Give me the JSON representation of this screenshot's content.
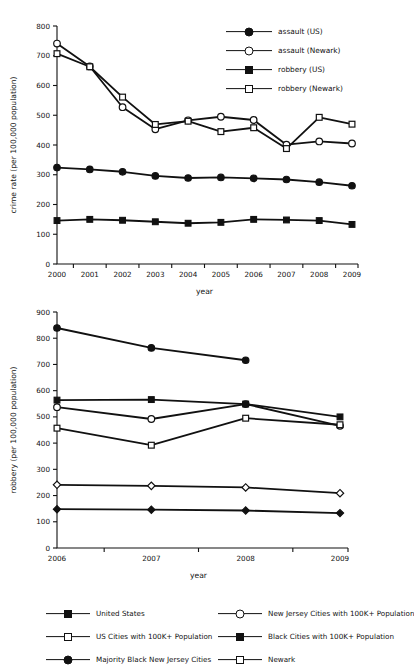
{
  "chart_data": [
    {
      "type": "line",
      "id": "crime-rate-us-newark",
      "title": "",
      "xlabel": "year",
      "ylabel": "crime rate (per 100,000 population)",
      "x": [
        2000,
        2001,
        2002,
        2003,
        2004,
        2005,
        2006,
        2007,
        2008,
        2009
      ],
      "xticklabels": [
        "2000",
        "2001",
        "2002",
        "2003",
        "2004",
        "2005",
        "2006",
        "2007",
        "2008",
        "2009"
      ],
      "yticks": [
        0,
        100,
        200,
        300,
        400,
        500,
        600,
        700,
        800
      ],
      "yticklabels": [
        "0",
        "100",
        "200",
        "300",
        "400",
        "500",
        "600",
        "700",
        "800"
      ],
      "ylim": [
        0,
        800
      ],
      "grid": false,
      "legend_position": "upper right",
      "series": [
        {
          "name": "assault (US)",
          "marker": "circle-filled",
          "values": [
            324,
            318,
            310,
            296,
            289,
            291,
            288,
            284,
            275,
            263
          ]
        },
        {
          "name": "assault (Newark)",
          "marker": "circle-open",
          "values": [
            741,
            664,
            527,
            453,
            483,
            495,
            484,
            401,
            412,
            405
          ]
        },
        {
          "name": "robbery (US)",
          "marker": "square-filled",
          "values": [
            146,
            150,
            147,
            142,
            137,
            140,
            150,
            148,
            146,
            133
          ]
        },
        {
          "name": "robbery (Newark)",
          "marker": "square-open",
          "values": [
            707,
            663,
            561,
            469,
            480,
            445,
            458,
            388,
            493,
            470
          ]
        }
      ]
    },
    {
      "type": "line",
      "id": "robbery-city-comparison",
      "title": "",
      "xlabel": "year",
      "ylabel": "robbery (per 100,000 population)",
      "x": [
        2006,
        2007,
        2008,
        2009
      ],
      "xticklabels": [
        "2006",
        "2007",
        "2008",
        "2009"
      ],
      "yticks": [
        0,
        100,
        200,
        300,
        400,
        500,
        600,
        700,
        800,
        900
      ],
      "yticklabels": [
        "0",
        "100",
        "200",
        "300",
        "400",
        "500",
        "600",
        "700",
        "800",
        "900"
      ],
      "ylim": [
        0,
        900
      ],
      "grid": false,
      "legend_position": "below",
      "series": [
        {
          "name": "United States",
          "marker": "diamond-filled",
          "values": [
            148,
            146,
            143,
            133
          ]
        },
        {
          "name": "US Cities with 100K+ Population",
          "marker": "diamond-open",
          "values": [
            241,
            237,
            231,
            209
          ]
        },
        {
          "name": "New Jersey Cities with 100K+ Population",
          "marker": "circle-open",
          "values": [
            537,
            492,
            549,
            466
          ]
        },
        {
          "name": "Black Cities with 100K+ Population",
          "marker": "square-filled",
          "values": [
            564,
            566,
            549,
            500
          ]
        },
        {
          "name": "Majority Black New Jersey Cities",
          "marker": "circle-filled",
          "values": [
            839,
            763,
            716,
            null
          ]
        },
        {
          "name": "Newark",
          "marker": "square-open",
          "values": [
            457,
            392,
            495,
            470
          ]
        }
      ]
    }
  ],
  "figure_top": {
    "ylabel": "crime rate (per 100,000 population)",
    "xlabel": "year",
    "legend": [
      {
        "label": "assault (US)",
        "marker": "circle-filled"
      },
      {
        "label": "assault (Newark)",
        "marker": "circle-open"
      },
      {
        "label": "robbery (US)",
        "marker": "square-filled"
      },
      {
        "label": "robbery (Newark)",
        "marker": "square-open"
      }
    ]
  },
  "figure_bottom": {
    "ylabel": "robbery (per 100,000 population)",
    "xlabel": "year",
    "legend_left": [
      {
        "label": "United States",
        "marker": "diamond-filled"
      },
      {
        "label": "US Cities with 100K+ Population",
        "marker": "diamond-open"
      },
      {
        "label": "Majority Black New Jersey Cities",
        "marker": "circle-filled"
      }
    ],
    "legend_right": [
      {
        "label": "New Jersey Cities with 100K+ Population",
        "marker": "circle-open"
      },
      {
        "label": "Black Cities with 100K+ Population",
        "marker": "square-filled"
      },
      {
        "label": "Newark",
        "marker": "square-open"
      }
    ]
  },
  "caption": ""
}
